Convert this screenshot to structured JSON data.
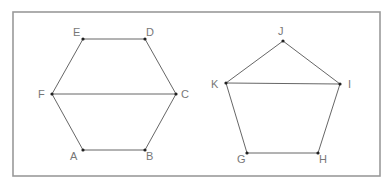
{
  "figures": [
    {
      "name": "hexagon",
      "vertices": [
        {
          "label": "A"
        },
        {
          "label": "B"
        },
        {
          "label": "C"
        },
        {
          "label": "D"
        },
        {
          "label": "E"
        },
        {
          "label": "F"
        }
      ],
      "edges": [
        [
          "A",
          "B"
        ],
        [
          "B",
          "C"
        ],
        [
          "C",
          "D"
        ],
        [
          "D",
          "E"
        ],
        [
          "E",
          "F"
        ],
        [
          "F",
          "A"
        ],
        [
          "F",
          "C"
        ]
      ]
    },
    {
      "name": "pentagon",
      "vertices": [
        {
          "label": "G"
        },
        {
          "label": "H"
        },
        {
          "label": "I"
        },
        {
          "label": "J"
        },
        {
          "label": "K"
        }
      ],
      "edges": [
        [
          "G",
          "H"
        ],
        [
          "H",
          "I"
        ],
        [
          "I",
          "J"
        ],
        [
          "J",
          "K"
        ],
        [
          "K",
          "G"
        ],
        [
          "K",
          "I"
        ]
      ]
    }
  ],
  "colors": {
    "frame": "#9a9a9a",
    "edge": "#555555",
    "vertex": "#222222",
    "label": "#777777"
  }
}
